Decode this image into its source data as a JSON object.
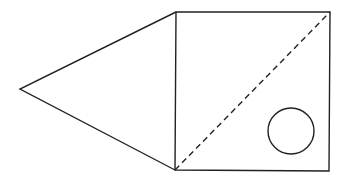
{
  "diagram": {
    "width": 349,
    "height": 185,
    "background": "#ffffff",
    "stroke_color": "#222222",
    "stroke_width": 1.4,
    "points": {
      "apex": {
        "x": 20,
        "y": 89
      },
      "square_top_left": {
        "x": 176,
        "y": 12
      },
      "square_top_right": {
        "x": 330,
        "y": 12
      },
      "square_bottom_right": {
        "x": 329,
        "y": 171
      },
      "square_bottom_left": {
        "x": 175,
        "y": 170
      }
    },
    "triangle": {
      "vertices": [
        "apex",
        "square_top_left",
        "square_bottom_left"
      ]
    },
    "square": {
      "vertices": [
        "square_top_left",
        "square_top_right",
        "square_bottom_right",
        "square_bottom_left"
      ]
    },
    "dashed_diagonal": {
      "from": "square_bottom_left",
      "to": "square_top_right",
      "dash": "6,4"
    },
    "circle": {
      "cx": 291,
      "cy": 131,
      "r": 23
    }
  }
}
